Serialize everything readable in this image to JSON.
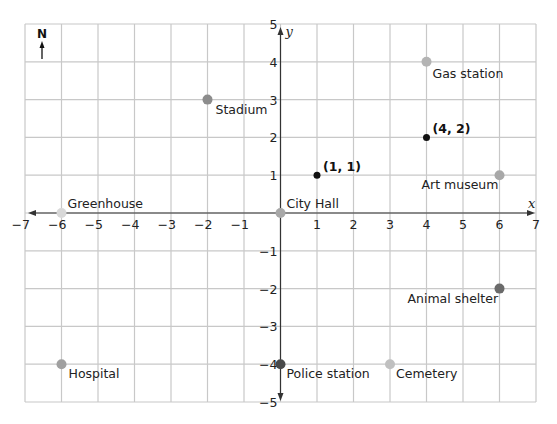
{
  "chart_data": {
    "type": "scatter",
    "title": "",
    "xlabel": "x",
    "ylabel": "y",
    "xlim": [
      -7,
      7
    ],
    "ylim": [
      -5,
      5
    ],
    "grid": true,
    "x_ticks": [
      -7,
      -6,
      -5,
      -4,
      -3,
      -2,
      -1,
      1,
      2,
      3,
      4,
      5,
      6,
      7
    ],
    "y_ticks": [
      -5,
      -4,
      -3,
      -2,
      -1,
      1,
      2,
      3,
      4,
      5
    ],
    "compass": "N",
    "points": [
      {
        "name": "Stadium",
        "x": -2,
        "y": 3,
        "color": "#8c8c8c",
        "label_dx": 8,
        "label_dy": 14
      },
      {
        "name": "Gas station",
        "x": 4,
        "y": 4,
        "color": "#b4b4b4",
        "label_dx": 6,
        "label_dy": 16
      },
      {
        "name": "(4, 2)",
        "x": 4,
        "y": 2,
        "color": "#111111",
        "bold": true,
        "small": true,
        "label_dx": 6,
        "label_dy": -4
      },
      {
        "name": "(1, 1)",
        "x": 1,
        "y": 1,
        "color": "#111111",
        "bold": true,
        "small": true,
        "label_dx": 6,
        "label_dy": -4
      },
      {
        "name": "Art museum",
        "x": 6,
        "y": 1,
        "color": "#a8a8a8",
        "label_dx": -78,
        "label_dy": 14
      },
      {
        "name": "Greenhouse",
        "x": -6,
        "y": 0,
        "color": "#d8d8d8",
        "label_dx": 6,
        "label_dy": -5
      },
      {
        "name": "City Hall",
        "x": 0,
        "y": 0,
        "color": "#a8a8a8",
        "label_dx": 6,
        "label_dy": -5
      },
      {
        "name": "Animal shelter",
        "x": 6,
        "y": -2,
        "color": "#6a6a6a",
        "label_dx": -92,
        "label_dy": 14
      },
      {
        "name": "Hospital",
        "x": -6,
        "y": -4,
        "color": "#a0a0a0",
        "label_dx": 7,
        "label_dy": 14
      },
      {
        "name": "Police station",
        "x": 0,
        "y": -4,
        "color": "#4a4a4a",
        "label_dx": 6,
        "label_dy": 14
      },
      {
        "name": "Cemetery",
        "x": 3,
        "y": -4,
        "color": "#c0c0c0",
        "label_dx": 6,
        "label_dy": 14
      }
    ]
  }
}
